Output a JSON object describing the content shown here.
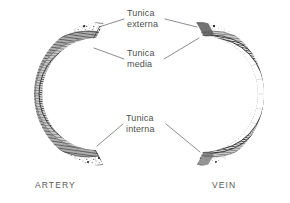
{
  "figure": {
    "background_color": "#ffffff",
    "ink_color": "#4f4f4f",
    "leader_color": "#555c63"
  },
  "labels": {
    "tunica_externa": {
      "line1": "Tunica",
      "line2": "externa"
    },
    "tunica_media": {
      "line1": "Tunica",
      "line2": "media"
    },
    "tunica_interna": {
      "line1": "Tunica",
      "line2": "interna"
    }
  },
  "vessels": {
    "artery": {
      "name": "ARTERY",
      "wall": "thick",
      "layers": [
        "tunica externa",
        "tunica media",
        "tunica interna"
      ]
    },
    "vein": {
      "name": "VEIN",
      "wall": "thin",
      "layers": [
        "tunica externa",
        "tunica media",
        "tunica interna"
      ]
    }
  }
}
